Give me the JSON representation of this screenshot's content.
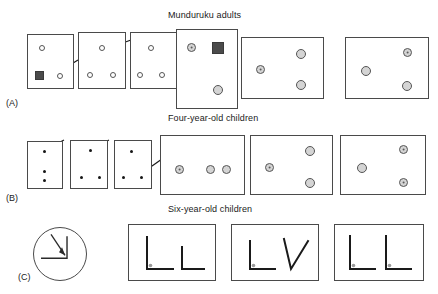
{
  "figure": {
    "rows": [
      {
        "id": "A",
        "label": "(A)",
        "title": "Munduruku adults",
        "title_x": 168,
        "title_y": 10,
        "label_x": 6,
        "label_y": 98,
        "panels": [
          {
            "name": "panel-a1",
            "x": 27,
            "y": 34,
            "w": 47,
            "h": 55,
            "shapes": [
              {
                "type": "circ-open",
                "name": "circle-open",
                "x": 11,
                "y": 10,
                "d": 6
              },
              {
                "type": "sq-dark",
                "name": "dark-square",
                "x": 7,
                "y": 36,
                "w": 9,
                "h": 9
              },
              {
                "type": "circ-open",
                "name": "circle-open",
                "x": 29,
                "y": 38,
                "d": 6
              }
            ]
          },
          {
            "name": "panel-a2",
            "x": 78,
            "y": 32,
            "w": 48,
            "h": 57,
            "shapes": [
              {
                "type": "circ-open",
                "name": "circle-open",
                "x": 20,
                "y": 12,
                "d": 6
              },
              {
                "type": "circ-open",
                "name": "circle-open",
                "x": 8,
                "y": 39,
                "d": 6
              },
              {
                "type": "circ-open",
                "name": "circle-open",
                "x": 31,
                "y": 39,
                "d": 6
              }
            ]
          },
          {
            "name": "panel-a3",
            "x": 130,
            "y": 32,
            "w": 48,
            "h": 57,
            "shapes": [
              {
                "type": "circ-open",
                "name": "circle-open",
                "x": 17,
                "y": 12,
                "d": 6
              },
              {
                "type": "circ-open",
                "name": "circle-open",
                "x": 6,
                "y": 39,
                "d": 6
              },
              {
                "type": "circ-open",
                "name": "circle-open",
                "x": 28,
                "y": 39,
                "d": 6
              }
            ]
          },
          {
            "name": "panel-a4",
            "x": 176,
            "y": 29,
            "w": 62,
            "h": 80,
            "shapes": [
              {
                "type": "circ-target",
                "name": "target-circle",
                "x": 10,
                "y": 13,
                "d": 9
              },
              {
                "type": "sq-dark",
                "name": "dark-square",
                "x": 35,
                "y": 12,
                "w": 12,
                "h": 12
              },
              {
                "type": "circ-gray",
                "name": "gray-circle",
                "x": 36,
                "y": 55,
                "d": 10
              }
            ]
          },
          {
            "name": "panel-a5",
            "x": 241,
            "y": 37,
            "w": 83,
            "h": 62,
            "shapes": [
              {
                "type": "circ-target",
                "name": "target-circle",
                "x": 14,
                "y": 27,
                "d": 9
              },
              {
                "type": "circ-gray",
                "name": "gray-circle",
                "x": 54,
                "y": 11,
                "d": 10
              },
              {
                "type": "circ-gray",
                "name": "gray-circle",
                "x": 54,
                "y": 42,
                "d": 10
              }
            ]
          },
          {
            "name": "panel-a6",
            "x": 345,
            "y": 37,
            "w": 84,
            "h": 62,
            "shapes": [
              {
                "type": "circ-gray",
                "name": "gray-circle",
                "x": 15,
                "y": 28,
                "d": 10
              },
              {
                "type": "circ-target",
                "name": "target-circle",
                "x": 57,
                "y": 10,
                "d": 9
              },
              {
                "type": "circ-gray",
                "name": "gray-circle",
                "x": 56,
                "y": 43,
                "d": 10
              }
            ]
          }
        ],
        "arrows": [
          {
            "name": "arrow-a1",
            "x1": 78,
            "y1": 60,
            "x2": 60,
            "y2": 71
          },
          {
            "name": "arrow-a2",
            "x1": 131,
            "y1": 40,
            "x2": 103,
            "y2": 50
          },
          {
            "name": "arrow-a3",
            "x1": 182,
            "y1": 60,
            "x2": 161,
            "y2": 72
          }
        ]
      },
      {
        "id": "B",
        "label": "(B)",
        "title": "Four-year-old children",
        "title_x": 168,
        "title_y": 113,
        "label_x": 6,
        "label_y": 193,
        "panels": [
          {
            "name": "panel-b1",
            "x": 27,
            "y": 141,
            "w": 36,
            "h": 48,
            "shapes": [
              {
                "type": "dot-small",
                "name": "dot",
                "x": 15,
                "y": 8,
                "d": 3
              },
              {
                "type": "dot-small",
                "name": "dot",
                "x": 15,
                "y": 28,
                "d": 3
              },
              {
                "type": "dot-small",
                "name": "dot",
                "x": 15,
                "y": 37,
                "d": 3
              }
            ]
          },
          {
            "name": "panel-b2",
            "x": 70,
            "y": 140,
            "w": 38,
            "h": 49,
            "shapes": [
              {
                "type": "dot-small",
                "name": "dot",
                "x": 18,
                "y": 8,
                "d": 3
              },
              {
                "type": "dot-small",
                "name": "dot",
                "x": 9,
                "y": 35,
                "d": 3
              },
              {
                "type": "dot-small",
                "name": "dot",
                "x": 27,
                "y": 35,
                "d": 3
              }
            ]
          },
          {
            "name": "panel-b3",
            "x": 114,
            "y": 140,
            "w": 38,
            "h": 49,
            "shapes": [
              {
                "type": "dot-small",
                "name": "dot",
                "x": 15,
                "y": 9,
                "d": 3
              },
              {
                "type": "dot-small",
                "name": "dot",
                "x": 7,
                "y": 35,
                "d": 3
              },
              {
                "type": "dot-small",
                "name": "dot",
                "x": 25,
                "y": 35,
                "d": 3
              }
            ]
          },
          {
            "name": "panel-b4",
            "x": 160,
            "y": 135,
            "w": 85,
            "h": 60,
            "shapes": [
              {
                "type": "circ-target",
                "name": "target-circle",
                "x": 14,
                "y": 29,
                "d": 9
              },
              {
                "type": "circ-gray",
                "name": "gray-circle",
                "x": 45,
                "y": 29,
                "d": 9
              },
              {
                "type": "circ-gray",
                "name": "gray-circle",
                "x": 61,
                "y": 29,
                "d": 9
              }
            ]
          },
          {
            "name": "panel-b5",
            "x": 250,
            "y": 135,
            "w": 83,
            "h": 60,
            "shapes": [
              {
                "type": "circ-target",
                "name": "target-circle",
                "x": 14,
                "y": 27,
                "d": 9
              },
              {
                "type": "circ-gray",
                "name": "gray-circle",
                "x": 54,
                "y": 10,
                "d": 10
              },
              {
                "type": "circ-gray",
                "name": "gray-circle",
                "x": 54,
                "y": 42,
                "d": 10
              }
            ]
          },
          {
            "name": "panel-b6",
            "x": 340,
            "y": 135,
            "w": 86,
            "h": 60,
            "shapes": [
              {
                "type": "circ-gray",
                "name": "gray-circle",
                "x": 16,
                "y": 27,
                "d": 10
              },
              {
                "type": "circ-target",
                "name": "target-circle",
                "x": 58,
                "y": 9,
                "d": 9
              },
              {
                "type": "circ-target",
                "name": "target-circle",
                "x": 58,
                "y": 42,
                "d": 9
              }
            ]
          }
        ],
        "arrows": [
          {
            "name": "arrow-b1",
            "x1": 64,
            "y1": 140,
            "x2": 45,
            "y2": 150
          },
          {
            "name": "arrow-b2",
            "x1": 109,
            "y1": 140,
            "x2": 90,
            "y2": 150
          },
          {
            "name": "arrow-b3",
            "x1": 162,
            "y1": 159,
            "x2": 142,
            "y2": 173
          }
        ]
      },
      {
        "id": "C",
        "label": "(C)",
        "title": "Six-year-old children",
        "title_x": 168,
        "title_y": 204,
        "label_x": 18,
        "label_y": 272,
        "stimulus_circle": {
          "name": "stimulus-circle",
          "x": 33,
          "y": 227,
          "d": 54
        },
        "panels": [
          {
            "name": "panel-c1",
            "x": 128,
            "y": 224,
            "w": 88,
            "h": 57,
            "angles": [
              {
                "name": "angle-right-with-dot",
                "kind": "right",
                "dot": true,
                "ox": 16,
                "oy": 12,
                "vlen": 32,
                "hlen": 26
              },
              {
                "name": "angle-right",
                "kind": "right",
                "dot": false,
                "ox": 51,
                "oy": 22,
                "vlen": 22,
                "hlen": 22
              }
            ]
          },
          {
            "name": "panel-c2",
            "x": 231,
            "y": 224,
            "w": 88,
            "h": 57,
            "angles": [
              {
                "name": "angle-right-with-dot",
                "kind": "right",
                "dot": true,
                "ox": 16,
                "oy": 16,
                "vlen": 28,
                "hlen": 25
              },
              {
                "name": "angle-acute",
                "kind": "acute",
                "dot": false,
                "ox": 50,
                "oy": 14,
                "vlen": 30,
                "hlen": 24
              }
            ]
          },
          {
            "name": "panel-c3",
            "x": 334,
            "y": 224,
            "w": 90,
            "h": 57,
            "angles": [
              {
                "name": "angle-right-with-dot",
                "kind": "right",
                "dot": true,
                "ox": 13,
                "oy": 11,
                "vlen": 33,
                "hlen": 25
              },
              {
                "name": "angle-right-with-dot",
                "kind": "right",
                "dot": true,
                "ox": 49,
                "oy": 11,
                "vlen": 33,
                "hlen": 25
              }
            ]
          }
        ]
      }
    ]
  },
  "colors": {
    "panel_border": "#4a4a4a",
    "shape_outline": "#555555",
    "gray_fill": "#d4d4d4",
    "target_center": "#5a5a5a",
    "dark_square": "#4b4b4b",
    "dot": "#161616",
    "corner_dot": "#9a9a9a",
    "text": "#1a1a1a"
  }
}
